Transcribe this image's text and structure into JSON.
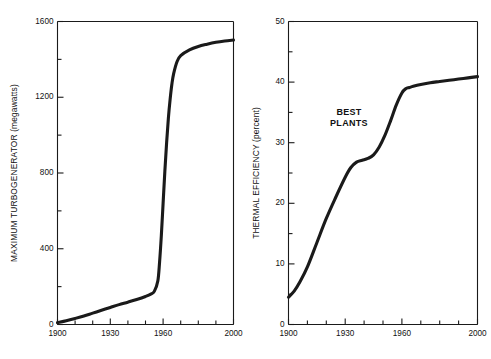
{
  "figure": {
    "background": "#ffffff",
    "curve_color": "#1a1a1a",
    "axis_color": "#1a1a1a"
  },
  "chart_data": [
    {
      "type": "line",
      "title": "",
      "xlabel": "",
      "ylabel": "MAXIMUM TURBOGENERATOR (megawatts)",
      "xlim": [
        1900,
        2000
      ],
      "ylim": [
        0,
        1600
      ],
      "grid": false,
      "legend": "none",
      "x_major_ticks": [
        1900,
        1930,
        1960,
        2000
      ],
      "x_major_tick_labels": [
        "1900",
        "1930",
        "1960",
        "2000"
      ],
      "x_minor_tick_step": 10,
      "y_major_ticks": [
        0,
        400,
        800,
        1200,
        1600
      ],
      "y_major_tick_labels": [
        "0",
        "400",
        "800",
        "1200",
        "1600"
      ],
      "y_minor_ticks": [
        200,
        600,
        1000,
        1400
      ],
      "x": [
        1900,
        1905,
        1910,
        1915,
        1920,
        1925,
        1930,
        1935,
        1940,
        1945,
        1950,
        1953,
        1955,
        1957,
        1958,
        1959,
        1960,
        1961,
        1962,
        1963,
        1964,
        1965,
        1966,
        1968,
        1970,
        1975,
        1980,
        1985,
        1990,
        1995,
        2000
      ],
      "y": [
        10,
        20,
        32,
        45,
        60,
        75,
        90,
        105,
        118,
        132,
        148,
        160,
        175,
        230,
        330,
        470,
        640,
        810,
        960,
        1090,
        1190,
        1270,
        1325,
        1390,
        1420,
        1450,
        1468,
        1480,
        1490,
        1497,
        1502
      ],
      "annotations": []
    },
    {
      "type": "line",
      "title": "",
      "xlabel": "",
      "ylabel": "THERMAL EFFICIENCY (percent)",
      "xlim": [
        1900,
        2000
      ],
      "ylim": [
        0,
        50
      ],
      "grid": false,
      "legend": "none",
      "x_major_ticks": [
        1900,
        1930,
        1960,
        2000
      ],
      "x_major_tick_labels": [
        "1900",
        "1930",
        "1960",
        "2000"
      ],
      "x_minor_tick_step": 10,
      "y_major_ticks": [
        0,
        10,
        20,
        30,
        40,
        50
      ],
      "y_major_tick_labels": [
        "0",
        "10",
        "20",
        "30",
        "40",
        "50"
      ],
      "y_minor_ticks": [
        5,
        15,
        25,
        35,
        45
      ],
      "x": [
        1900,
        1903,
        1906,
        1910,
        1915,
        1920,
        1925,
        1930,
        1933,
        1936,
        1939,
        1942,
        1945,
        1948,
        1951,
        1954,
        1957,
        1960,
        1962,
        1964,
        1966,
        1970,
        1975,
        1980,
        1985,
        1990,
        1995,
        2000
      ],
      "y": [
        4.5,
        5.5,
        7.0,
        9.5,
        13.5,
        17.5,
        21.0,
        24.3,
        25.9,
        26.8,
        27.1,
        27.4,
        28.0,
        29.3,
        31.2,
        33.6,
        36.2,
        38.2,
        38.9,
        39.1,
        39.3,
        39.6,
        39.9,
        40.1,
        40.3,
        40.5,
        40.7,
        40.9
      ],
      "annotations": [
        {
          "name": "best-plants-label",
          "lines": [
            "BEST",
            "PLANTS"
          ],
          "x": 1932,
          "y": 34.5
        }
      ]
    }
  ]
}
